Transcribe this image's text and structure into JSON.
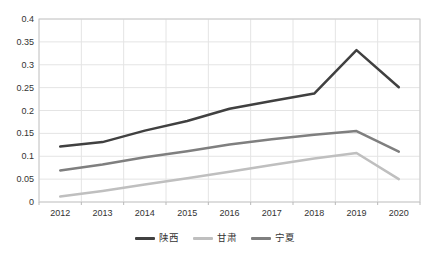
{
  "chart_data": {
    "type": "line",
    "title": "",
    "xlabel": "",
    "ylabel": "",
    "categories": [
      "2012",
      "2013",
      "2014",
      "2015",
      "2016",
      "2017",
      "2018",
      "2019",
      "2020"
    ],
    "series": [
      {
        "name": "陕西",
        "color": "#404040",
        "values": [
          0.121,
          0.131,
          0.156,
          0.177,
          0.204,
          0.221,
          0.237,
          0.332,
          0.251
        ]
      },
      {
        "name": "甘肃",
        "color": "#bfbfbf",
        "values": [
          0.012,
          0.024,
          0.038,
          0.052,
          0.066,
          0.081,
          0.095,
          0.107,
          0.05
        ]
      },
      {
        "name": "宁夏",
        "color": "#7f7f7f",
        "values": [
          0.069,
          0.082,
          0.098,
          0.111,
          0.126,
          0.137,
          0.147,
          0.155,
          0.11
        ]
      }
    ],
    "ylim": [
      0,
      0.4
    ],
    "y_ticks": [
      "0",
      "0.05",
      "0.1",
      "0.15",
      "0.2",
      "0.25",
      "0.3",
      "0.35",
      "0.4"
    ],
    "y_tick_values": [
      0,
      0.05,
      0.1,
      0.15,
      0.2,
      0.25,
      0.3,
      0.35,
      0.4
    ],
    "grid": true,
    "legend_position": "bottom"
  },
  "colors": {
    "background": "#ffffff",
    "gridline": "#e4e4e4",
    "plot_border": "#c9c9c9",
    "tick": "#b9b9b9",
    "text": "#333333"
  }
}
